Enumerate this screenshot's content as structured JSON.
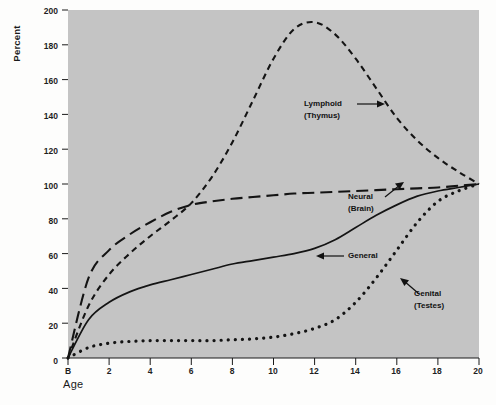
{
  "figure": {
    "background_color": "#c4c4c4",
    "page_color": "#fdfdfc",
    "axis_color": "#1a1a1a"
  },
  "axes": {
    "ylabel": "Percent",
    "xlabel": "Age",
    "yticks": [
      "0",
      "20",
      "40",
      "60",
      "80",
      "100",
      "120",
      "140",
      "160",
      "180",
      "200"
    ],
    "xticks": [
      "B",
      "2",
      "4",
      "6",
      "8",
      "10",
      "12",
      "14",
      "16",
      "18",
      "20"
    ]
  },
  "annotations": {
    "lymphoid": {
      "line1": "Lymphoid",
      "line2": "(Thymus)"
    },
    "neural": {
      "line1": "Neural",
      "line2": "(Brain)"
    },
    "general": {
      "line1": "General",
      "line2": ""
    },
    "genital": {
      "line1": "Genital",
      "line2": "(Testes)"
    }
  },
  "chart_data": {
    "type": "line",
    "title": "",
    "xlabel": "Age",
    "ylabel": "Percent",
    "xlim": [
      0,
      20
    ],
    "ylim": [
      0,
      200
    ],
    "xticks": [
      0,
      2,
      4,
      6,
      8,
      10,
      12,
      14,
      16,
      18,
      20
    ],
    "xtick_labels": [
      "B",
      "2",
      "4",
      "6",
      "8",
      "10",
      "12",
      "14",
      "16",
      "18",
      "20"
    ],
    "yticks": [
      0,
      20,
      40,
      60,
      80,
      100,
      120,
      140,
      160,
      180,
      200
    ],
    "grid": false,
    "legend": "inline-annotations",
    "x": [
      0,
      1,
      2,
      3,
      4,
      5,
      6,
      7,
      8,
      9,
      10,
      11,
      12,
      13,
      14,
      15,
      16,
      17,
      18,
      19,
      20
    ],
    "series": [
      {
        "name": "Lymphoid (Thymus)",
        "style": "short-dashed",
        "values": [
          0,
          30,
          48,
          60,
          70,
          79,
          89,
          104,
          124,
          148,
          172,
          189,
          193,
          186,
          172,
          155,
          138,
          125,
          115,
          107,
          100
        ]
      },
      {
        "name": "Neural (Brain)",
        "style": "long-dashed",
        "values": [
          0,
          46,
          62,
          71,
          78,
          84,
          88,
          90,
          91.5,
          92.5,
          93.5,
          94.5,
          95,
          95.5,
          96,
          96.5,
          97,
          97.5,
          98,
          99,
          100
        ]
      },
      {
        "name": "General",
        "style": "solid",
        "values": [
          0,
          22,
          32,
          38,
          42,
          45,
          48,
          51,
          54,
          56,
          58,
          60,
          63,
          68,
          75,
          82,
          88,
          93,
          96,
          98,
          100
        ]
      },
      {
        "name": "Genital (Testes)",
        "style": "dotted",
        "values": [
          0,
          6,
          8.5,
          9.5,
          10,
          10,
          10,
          10,
          10.5,
          11,
          12,
          14,
          17,
          22,
          32,
          46,
          62,
          78,
          90,
          96,
          100
        ]
      }
    ]
  }
}
